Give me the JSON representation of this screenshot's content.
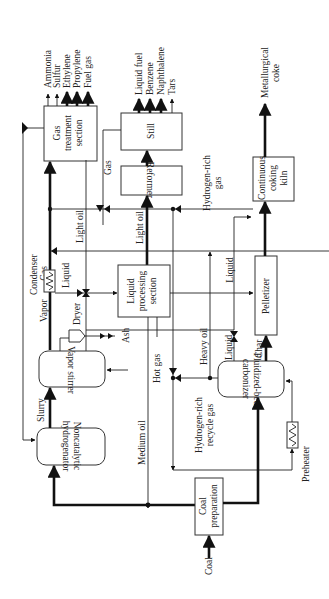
{
  "diagram": {
    "type": "process-flow",
    "orientation": "rotated-90",
    "units": {
      "gas_treatment": "Gas treatment section",
      "still": "Still",
      "reformer": "Reformer",
      "liquid_processing": "Liquid processing section",
      "continuous_coking_kiln": "Continuous coking kiln",
      "pelletizer": "Pelletizer",
      "vapor_stirrer": "Vapor stirrer",
      "dryer": "Dryer",
      "condenser": "Condenser",
      "fluidized_bed_carbonizer": "Fluidized-bed carbonizer",
      "noncatalytic_hydrogenator": "Noncatalytic hydrogenator",
      "coal_preparation": "Coal preparation",
      "preheater": "Preheater"
    },
    "unit_lines": {
      "gas_treatment": [
        "Gas",
        "treatment",
        "section"
      ],
      "liquid_processing": [
        "Liquid",
        "processing",
        "section"
      ],
      "continuous_coking_kiln": [
        "Continuous",
        "coking",
        "kiln"
      ],
      "fluidized_bed_carbonizer": [
        "Fluidized-bed",
        "carbonizer"
      ],
      "noncatalytic_hydrogenator": [
        "Noncatalytic",
        "hydrogenator"
      ],
      "coal_preparation": [
        "Coal",
        "preparation"
      ]
    },
    "gas_products": [
      "Ammonia",
      "Sulfur",
      "Ethylene",
      "Propylene",
      "Fuel gas"
    ],
    "still_products": [
      "Liquid fuel",
      "Benzene",
      "Naphthalene",
      "Tars"
    ],
    "kiln_product": [
      "Metallurgical",
      "coke"
    ],
    "streams": {
      "gas_top": "Gas",
      "gas_condenser": "Gas",
      "light_oil_1": "Light oil",
      "light_oil_2": "Light oil",
      "liquid_condenser": "Liquid",
      "liquid_right": "Liquid",
      "liquid_carbonizer": "Liquid",
      "vapor": "Vapor",
      "ash": "Ash",
      "hot_gas": "Hot gas",
      "slurry": "Slurry",
      "medium_oil": "Medium oil",
      "heavy_oil": "Heavy oil",
      "char": "Char",
      "coal": "Coal",
      "hydrogen_rich_gas": [
        "Hydrogen-rich",
        "gas"
      ],
      "hydrogen_rich_recycle_gas": [
        "Hydrogen-rich",
        "recycle gas"
      ]
    }
  }
}
